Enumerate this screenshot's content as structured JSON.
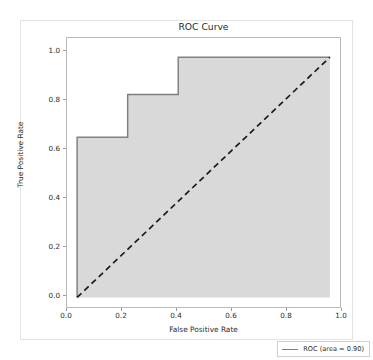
{
  "figure": {
    "title": "ROC Curve",
    "width": 373,
    "height": 360
  },
  "chart_data": {
    "type": "line",
    "title": "ROC Curve",
    "xlabel": "False Positive Rate",
    "ylabel": "True Positive Rate",
    "xlim": [
      -0.04,
      1.04
    ],
    "ylim": [
      -0.04,
      1.08
    ],
    "xticks": [
      "0.0",
      "0.2",
      "0.4",
      "0.6",
      "0.8",
      "1.0"
    ],
    "yticks": [
      "0.0",
      "0.2",
      "0.4",
      "0.6",
      "0.8",
      "1.0"
    ],
    "xtick_values": [
      0.0,
      0.2,
      0.4,
      0.6,
      0.8,
      1.0
    ],
    "ytick_values": [
      0.0,
      0.2,
      0.4,
      0.6,
      0.8,
      1.0
    ],
    "grid": false,
    "legend_position": "lower right",
    "series": [
      {
        "name": "ROC (area = 0.90)",
        "drawstyle": "steps-post",
        "filled": true,
        "fill_color": "#d9d9d9",
        "line_color": "#808080",
        "x": [
          0.0,
          0.0,
          0.2,
          0.2,
          0.4,
          0.4,
          1.0
        ],
        "y": [
          0.0,
          0.667,
          0.667,
          0.845,
          0.845,
          1.0,
          1.0
        ]
      },
      {
        "name": "chance-diagonal",
        "linestyle": "dashed",
        "line_color": "#1a1a1a",
        "x": [
          0.0,
          1.0
        ],
        "y": [
          0.0,
          1.0
        ]
      }
    ],
    "annotations": [],
    "auc": 0.9
  },
  "legend": {
    "entries": [
      {
        "label": "ROC (area = 0.90)",
        "color": "#6f7f9c"
      }
    ]
  },
  "colors": {
    "roc_line": "#808080",
    "roc_fill": "#d9d9d9",
    "diagonal": "#1a1a1a",
    "axis": "#b9b9b9",
    "text": "#2b2b2b"
  }
}
